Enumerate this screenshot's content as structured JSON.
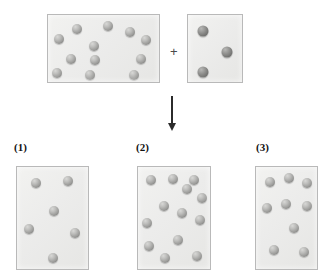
{
  "figure": {
    "type": "particle-diagram",
    "background_color": "#ffffff",
    "box_fill_color": "#ececeb",
    "box_border_color": "#b9b9b9",
    "light_sphere_color": "#9e9e9c",
    "dark_sphere_color": "#7e7e7c",
    "arrow_color": "#2b2b2b",
    "label_color": "#121212"
  },
  "operators": {
    "plus": "+",
    "plus_position": {
      "x": 170,
      "y": 45
    },
    "arrow": {
      "direction": "down",
      "x": 172,
      "y_start": 96,
      "y_end": 131
    }
  },
  "reactants": [
    {
      "id": "reactant-a",
      "sphere_count": 12,
      "sphere_type": "light",
      "sphere_diameter": 10,
      "box": {
        "x": 47,
        "y": 14,
        "width": 113,
        "height": 69
      },
      "spheres": [
        {
          "x": 29,
          "y": 14
        },
        {
          "x": 60,
          "y": 11
        },
        {
          "x": 11,
          "y": 24
        },
        {
          "x": 82,
          "y": 17
        },
        {
          "x": 98,
          "y": 25
        },
        {
          "x": 46,
          "y": 31
        },
        {
          "x": 23,
          "y": 44
        },
        {
          "x": 47,
          "y": 45
        },
        {
          "x": 93,
          "y": 44
        },
        {
          "x": 9,
          "y": 58
        },
        {
          "x": 42,
          "y": 60
        },
        {
          "x": 86,
          "y": 60
        }
      ]
    },
    {
      "id": "reactant-b",
      "sphere_count": 3,
      "sphere_type": "dark",
      "sphere_diameter": 11,
      "box": {
        "x": 187,
        "y": 14,
        "width": 56,
        "height": 69
      },
      "spheres": [
        {
          "x": 15,
          "y": 16
        },
        {
          "x": 39,
          "y": 37
        },
        {
          "x": 15,
          "y": 57
        }
      ]
    }
  ],
  "choices": [
    {
      "id": "choice-1",
      "label": "(1)",
      "label_position": {
        "x": 14,
        "y": 142
      },
      "sphere_count": 6,
      "sphere_type": "light",
      "sphere_diameter": 10,
      "box": {
        "x": 16,
        "y": 166,
        "width": 73,
        "height": 104
      },
      "spheres": [
        {
          "x": 19,
          "y": 16
        },
        {
          "x": 51,
          "y": 14
        },
        {
          "x": 37,
          "y": 44
        },
        {
          "x": 12,
          "y": 62
        },
        {
          "x": 58,
          "y": 66
        },
        {
          "x": 36,
          "y": 91
        }
      ]
    },
    {
      "id": "choice-2",
      "label": "(2)",
      "label_position": {
        "x": 136,
        "y": 142
      },
      "sphere_count": 13,
      "sphere_type": "light",
      "sphere_diameter": 10,
      "box": {
        "x": 137,
        "y": 166,
        "width": 74,
        "height": 104
      },
      "spheres": [
        {
          "x": 13,
          "y": 13
        },
        {
          "x": 35,
          "y": 12
        },
        {
          "x": 56,
          "y": 13
        },
        {
          "x": 64,
          "y": 31
        },
        {
          "x": 26,
          "y": 39
        },
        {
          "x": 44,
          "y": 46
        },
        {
          "x": 9,
          "y": 56
        },
        {
          "x": 62,
          "y": 53
        },
        {
          "x": 40,
          "y": 73
        },
        {
          "x": 11,
          "y": 79
        },
        {
          "x": 27,
          "y": 91
        },
        {
          "x": 59,
          "y": 89
        },
        {
          "x": 49,
          "y": 22
        }
      ]
    },
    {
      "id": "choice-3",
      "label": "(3)",
      "label_position": {
        "x": 256,
        "y": 142
      },
      "sphere_count": 9,
      "sphere_type": "light",
      "sphere_diameter": 10,
      "box": {
        "x": 255,
        "y": 166,
        "width": 63,
        "height": 104
      },
      "spheres": [
        {
          "x": 14,
          "y": 15
        },
        {
          "x": 33,
          "y": 11
        },
        {
          "x": 51,
          "y": 16
        },
        {
          "x": 11,
          "y": 41
        },
        {
          "x": 30,
          "y": 37
        },
        {
          "x": 51,
          "y": 39
        },
        {
          "x": 38,
          "y": 61
        },
        {
          "x": 18,
          "y": 83
        },
        {
          "x": 48,
          "y": 85
        }
      ]
    }
  ]
}
